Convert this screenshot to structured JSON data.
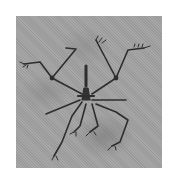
{
  "image": {
    "description": "Grayscale photograph of a fossil skeleton with outstretched limbs on a textured stone slab",
    "background_color": "#a2a2a2",
    "page_color": "#ffffff",
    "fossil_color": "#2e2e2e"
  }
}
